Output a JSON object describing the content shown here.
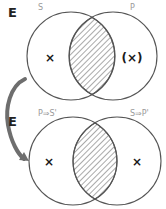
{
  "colors": {
    "circle_stroke": "#555555",
    "hatch": "#555555",
    "label_gray": "#9a9a9a",
    "arrow": "#6e6e6e",
    "mark": "#1a1a1a"
  },
  "diagrams": [
    {
      "universe_label": "E",
      "left_set": {
        "label": "S",
        "cx": 71,
        "cy": 56,
        "r": 44
      },
      "right_set": {
        "label": "P",
        "cx": 113,
        "cy": 56,
        "r": 44
      },
      "intersection": "hatched",
      "marks": {
        "left_only": "×",
        "right_only": "(×)"
      }
    },
    {
      "universe_label": "E",
      "left_set": {
        "label": "P⇒S'",
        "cx": 73,
        "cy": 161,
        "r": 44
      },
      "right_set": {
        "label": "S⇒P'",
        "cx": 117,
        "cy": 161,
        "r": 44
      },
      "intersection": "hatched",
      "marks": {
        "left_only": "×",
        "right_only": "×"
      }
    }
  ],
  "connector": {
    "type": "curved-arrow",
    "from": "diagram-top",
    "to": "diagram-bottom"
  }
}
